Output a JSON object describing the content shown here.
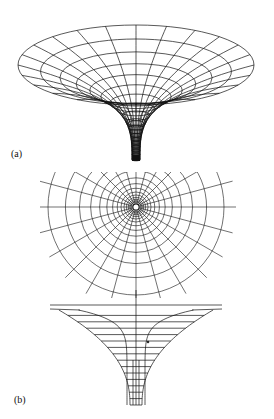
{
  "figure": {
    "panels": [
      {
        "id": "a",
        "label": "(a)",
        "description": "3D embedding diagram of a black hole / wormhole funnel with polar grid"
      },
      {
        "id": "b",
        "label": "(b)",
        "description": "Top view polar grid (upper) and side-view embedding profile (lower)"
      }
    ],
    "colors": {
      "line": "#111111",
      "background": "#ffffff"
    },
    "funnel_a": {
      "cx": 136,
      "top_cy": 65,
      "top_rx": 118,
      "top_ry": 40,
      "rings": 9,
      "spokes": 24
    },
    "polar_b": {
      "cx": 136,
      "cy": 207,
      "rings": 14,
      "spokes": 24,
      "max_r": 88,
      "clip_top": 172,
      "clip_bottom": 298
    },
    "profile_b": {
      "top_y": 305,
      "bottom_y": 405,
      "left_x": 50,
      "right_x": 222,
      "horizontal_lines": 15
    }
  }
}
